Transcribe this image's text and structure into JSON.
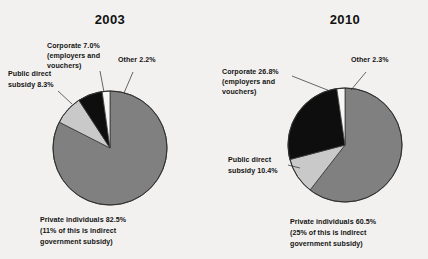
{
  "figure": {
    "background_color": "#f2f1ef",
    "text_color": "#141414"
  },
  "colors": {
    "private_individuals": "#808080",
    "public_direct_subsidy": "#c9c9c9",
    "corporate": "#0e0e0e",
    "other": "#f7f7f5",
    "outline": "#2f2f2f"
  },
  "charts": [
    {
      "id": "pie-2003",
      "title": "2003",
      "labels": {
        "corporate": "Corporate 7.0%",
        "corporate_sub1": "(employers and",
        "corporate_sub2": "vouchers)",
        "other": "Other 2.2%",
        "public_line1": "Public direct",
        "public_line2": "subsidy 8.3%",
        "private_line1": "Private individuals 82.5%",
        "private_line2": "(11% of this is indirect",
        "private_line3": "government subsidy)"
      }
    },
    {
      "id": "pie-2010",
      "title": "2010",
      "labels": {
        "corporate": "Corporate 26.8%",
        "corporate_sub1": "(employers and",
        "corporate_sub2": "vouchers)",
        "other": "Other 2.3%",
        "public_line1": "Public direct",
        "public_line2": "subsidy 10.4%",
        "private_line1": "Private individuals 60.5%",
        "private_line2": "(25% of this is indirect",
        "private_line3": "government subsidy)"
      }
    }
  ],
  "chart_data": [
    {
      "type": "pie",
      "title": "2003",
      "labels": [
        "Private individuals",
        "Public direct subsidy",
        "Corporate (employers and vouchers)",
        "Other"
      ],
      "values": [
        82.5,
        8.3,
        7.0,
        2.2
      ],
      "units": "percent",
      "colors": [
        "#808080",
        "#c9c9c9",
        "#0e0e0e",
        "#f7f7f5"
      ],
      "start_angle_deg": -90,
      "direction": "clockwise",
      "annotations": [
        "Private individuals 82.5% (11% of this is indirect government subsidy)",
        "Public direct subsidy 8.3%",
        "Corporate 7.0% (employers and vouchers)",
        "Other 2.2%"
      ],
      "legend": "none",
      "grid": false
    },
    {
      "type": "pie",
      "title": "2010",
      "labels": [
        "Private individuals",
        "Public direct subsidy",
        "Corporate (employers and vouchers)",
        "Other"
      ],
      "values": [
        60.5,
        10.4,
        26.8,
        2.3
      ],
      "units": "percent",
      "colors": [
        "#808080",
        "#c9c9c9",
        "#0e0e0e",
        "#f7f7f5"
      ],
      "start_angle_deg": -90,
      "direction": "clockwise",
      "annotations": [
        "Private individuals 60.5% (25% of this is indirect government subsidy)",
        "Public direct subsidy 10.4%",
        "Corporate 26.8% (employers and vouchers)",
        "Other 2.3%"
      ],
      "legend": "none",
      "grid": false
    }
  ]
}
